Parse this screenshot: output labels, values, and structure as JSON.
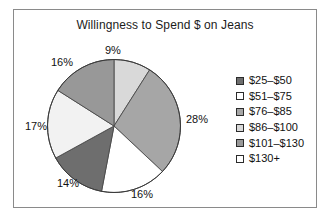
{
  "figure": {
    "border_color": "#8a8a8a",
    "background": "#ffffff"
  },
  "chart_data": {
    "type": "pie",
    "title": "Willingness to Spend $ on Jeans",
    "xlabel": "",
    "ylabel": "",
    "legend_position": "right",
    "grid": false,
    "categories": [
      "$25–$50",
      "$51–$75",
      "$76–$85",
      "$86–$100",
      "$101–$130",
      "$130+"
    ],
    "values": [
      14,
      16,
      28,
      9,
      16,
      17
    ],
    "value_labels": [
      "14%",
      "16%",
      "28%",
      "9%",
      "16%",
      "17%"
    ],
    "colors": [
      "#6e6e6e",
      "#ffffff",
      "#a6a6a6",
      "#d9d9d9",
      "#989898",
      "#f2f2f2"
    ],
    "slices_clockwise_from_top": [
      {
        "label": "9%",
        "value": 9,
        "category": "$86–$100",
        "color": "#d9d9d9"
      },
      {
        "label": "28%",
        "value": 28,
        "category": "$76–$85",
        "color": "#a6a6a6"
      },
      {
        "label": "16%",
        "value": 16,
        "category": "$51–$75",
        "color": "#ffffff"
      },
      {
        "label": "14%",
        "value": 14,
        "category": "$25–$50",
        "color": "#6e6e6e"
      },
      {
        "label": "17%",
        "value": 17,
        "category": "$130+",
        "color": "#f2f2f2"
      },
      {
        "label": "16%",
        "value": 16,
        "category": "$101–$130",
        "color": "#989898"
      }
    ]
  },
  "labels": {
    "top": "9%",
    "right": "28%",
    "bottom": "16%",
    "bottom_left": "14%",
    "left": "17%",
    "top_left": "16%"
  },
  "legend": {
    "items": [
      {
        "label": "$25–$50",
        "color": "#6e6e6e"
      },
      {
        "label": "$51–$75",
        "color": "#ffffff"
      },
      {
        "label": "$76–$85",
        "color": "#a6a6a6"
      },
      {
        "label": "$86–$100",
        "color": "#d9d9d9"
      },
      {
        "label": "$101–$130",
        "color": "#989898"
      },
      {
        "label": "$130+",
        "color": "#ffffff"
      }
    ]
  }
}
